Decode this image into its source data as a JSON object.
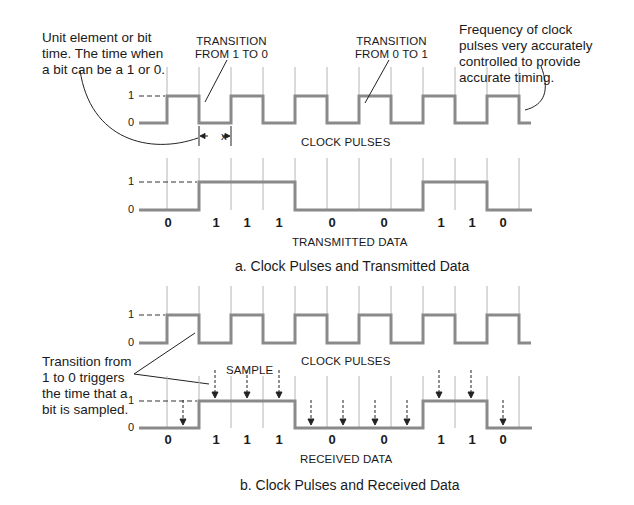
{
  "annotations": {
    "unit_element": "Unit element or bit time. The time when a bit can be a 1 or 0.",
    "transition_1_to_0": [
      "TRANSITION",
      "FROM 1 TO 0"
    ],
    "transition_0_to_1": [
      "TRANSITION",
      "FROM 0 TO 1"
    ],
    "frequency_note": "Frequency of clock pulses very accurately controlled to provide accurate timing.",
    "trigger_note": "Transition from 1 to 0 triggers the time that a bit is sampled.",
    "sample_label": "SAMPLE",
    "bit_width_label": "x"
  },
  "levels": {
    "high": "1",
    "low": "0"
  },
  "panel_a": {
    "clock_label": "CLOCK PULSES",
    "data_label": "TRANSMITTED DATA",
    "caption": "a. Clock Pulses and Transmitted Data",
    "bits": [
      "0",
      "1",
      "1",
      "1",
      "0",
      "0",
      "1",
      "1",
      "0"
    ]
  },
  "panel_b": {
    "clock_label": "CLOCK PULSES",
    "data_label": "RECEIVED DATA",
    "caption": "b. Clock Pulses and Received Data",
    "bits": [
      "0",
      "1",
      "1",
      "1",
      "0",
      "0",
      "1",
      "1",
      "0"
    ]
  },
  "colors": {
    "waveform": "#8a8a8a",
    "gridline": "#b0b0b0",
    "text": "#1a1a1a"
  }
}
